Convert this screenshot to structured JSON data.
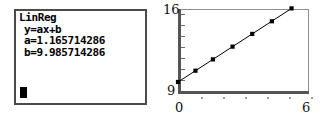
{
  "calculator": {
    "readout": {
      "title": "LinReg",
      "model": "y=ax+b",
      "slope": "a=1.165714286",
      "intercept": "b=9.985714286"
    },
    "cursor": "cursor-block"
  },
  "chart_data": {
    "type": "scatter",
    "title": "",
    "xlabel": "",
    "ylabel": "",
    "xlim": [
      0,
      6
    ],
    "ylim": [
      9,
      16
    ],
    "xticks": [
      "0",
      "6"
    ],
    "yticks": [
      "9",
      "16"
    ],
    "grid": false,
    "legend": false,
    "points": [
      {
        "x": 0.0,
        "y": 9.99
      },
      {
        "x": 0.8,
        "y": 10.92
      },
      {
        "x": 1.6,
        "y": 11.85
      },
      {
        "x": 2.5,
        "y": 12.9
      },
      {
        "x": 3.4,
        "y": 13.95
      },
      {
        "x": 4.3,
        "y": 14.99
      },
      {
        "x": 5.2,
        "y": 16.05
      }
    ],
    "fit_line": {
      "type": "linear",
      "equation": "y=ax+b",
      "a": 1.165714286,
      "b": 9.985714286,
      "x_start": 0.0,
      "x_end": 5.2
    }
  },
  "plot_labels": {
    "y_max": "16",
    "y_min": "9",
    "x_min": "0",
    "x_max": "6"
  }
}
